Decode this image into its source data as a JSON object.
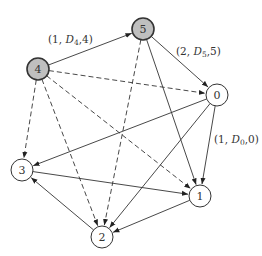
{
  "diagram": {
    "nodes": [
      {
        "id": "0",
        "label": "0",
        "x": 217,
        "y": 95,
        "r": 11,
        "fill": "#ffffff"
      },
      {
        "id": "1",
        "label": "1",
        "x": 200,
        "y": 196,
        "r": 11,
        "fill": "#ffffff"
      },
      {
        "id": "2",
        "label": "2",
        "x": 102,
        "y": 237,
        "r": 11,
        "fill": "#ffffff"
      },
      {
        "id": "3",
        "label": "3",
        "x": 22,
        "y": 170,
        "r": 11,
        "fill": "#ffffff"
      },
      {
        "id": "4",
        "label": "4",
        "x": 38,
        "y": 69,
        "r": 11,
        "fill": "#bfbfbf"
      },
      {
        "id": "5",
        "label": "5",
        "x": 143,
        "y": 29,
        "r": 11,
        "fill": "#bfbfbf"
      }
    ],
    "edges": [
      {
        "from": "4",
        "to": "5",
        "style": "solid"
      },
      {
        "from": "5",
        "to": "0",
        "style": "solid"
      },
      {
        "from": "4",
        "to": "0",
        "style": "dashed"
      },
      {
        "from": "4",
        "to": "3",
        "style": "dashed"
      },
      {
        "from": "4",
        "to": "2",
        "style": "dashed"
      },
      {
        "from": "4",
        "to": "1",
        "style": "dashed"
      },
      {
        "from": "5",
        "to": "2",
        "style": "dashed"
      },
      {
        "from": "5",
        "to": "1",
        "style": "solid"
      },
      {
        "from": "0",
        "to": "3",
        "style": "solid"
      },
      {
        "from": "0",
        "to": "2",
        "style": "solid"
      },
      {
        "from": "0",
        "to": "1",
        "style": "solid"
      },
      {
        "from": "3",
        "to": "1",
        "style": "solid"
      },
      {
        "from": "1",
        "to": "2",
        "style": "solid"
      },
      {
        "from": "2",
        "to": "3",
        "style": "solid"
      }
    ],
    "edge_labels": [
      {
        "id": "label-4-5",
        "x": 48,
        "y": 43,
        "prefix": "(1, ",
        "var": "D",
        "sub": "4",
        "suffix": ",4)"
      },
      {
        "id": "label-5-0",
        "x": 176,
        "y": 55,
        "prefix": "(2, ",
        "var": "D",
        "sub": "5",
        "suffix": ",5)"
      },
      {
        "id": "label-0-1",
        "x": 214,
        "y": 143,
        "prefix": "(1, ",
        "var": "D",
        "sub": "0",
        "suffix": ",0)"
      }
    ],
    "colors": {
      "stroke": "#333333",
      "highlight_fill": "#bfbfbf",
      "node_fill": "#ffffff"
    }
  }
}
